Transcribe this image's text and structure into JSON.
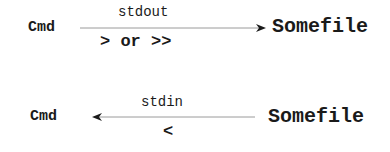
{
  "diagram": {
    "rows": [
      {
        "id": "stdout",
        "source": "Cmd",
        "target": "Somefile",
        "stream": "stdout",
        "operator": "> or >>",
        "direction": "right"
      },
      {
        "id": "stdin",
        "source": "Cmd",
        "target": "Somefile",
        "stream": "stdin",
        "operator": "<",
        "direction": "left"
      }
    ],
    "colors": {
      "text": "#1a1a1a",
      "line": "#9a9a9a",
      "arrowhead": "#1a1a1a"
    }
  }
}
